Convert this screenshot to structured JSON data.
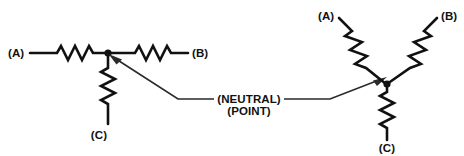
{
  "figure": {
    "type": "electrical-schematic",
    "background_color": "#ffffff",
    "line_color": "#111111",
    "leader_color": "#2a2a2a"
  },
  "left_figure": {
    "name": "horizontal-wye",
    "terminal_a_label": "(A)",
    "terminal_b_label": "(B)",
    "terminal_c_label": "(C)",
    "node_name": "neutral-point"
  },
  "right_figure": {
    "name": "y-wye",
    "terminal_a_label": "(A)",
    "terminal_b_label": "(B)",
    "terminal_c_label": "(C)",
    "node_name": "neutral-point"
  },
  "callout": {
    "line1": "(NEUTRAL)",
    "line2": "(POINT)"
  }
}
